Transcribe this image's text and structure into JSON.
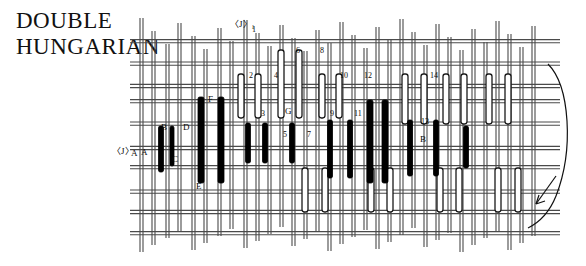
{
  "title": {
    "line1": "DOUBLE",
    "line2": "HUNGARIAN"
  },
  "markers": {
    "j_top": "〈J〉₁",
    "j_left": "〈J〉",
    "a_left_1": "A",
    "a_left_2": "A"
  },
  "letter_labels": [
    {
      "text": "B",
      "x": 161,
      "y": 123
    },
    {
      "text": "D",
      "x": 183,
      "y": 123
    },
    {
      "text": "C",
      "x": 172,
      "y": 155
    },
    {
      "text": "F",
      "x": 208,
      "y": 95
    },
    {
      "text": "E",
      "x": 196,
      "y": 182
    },
    {
      "text": "G",
      "x": 285,
      "y": 107
    },
    {
      "text": "B",
      "x": 420,
      "y": 135
    }
  ],
  "number_labels": [
    {
      "text": "1",
      "x": 252,
      "y": 26
    },
    {
      "text": "2",
      "x": 249,
      "y": 72
    },
    {
      "text": "4",
      "x": 274,
      "y": 72
    },
    {
      "text": "6",
      "x": 296,
      "y": 47
    },
    {
      "text": "8",
      "x": 320,
      "y": 47
    },
    {
      "text": "3",
      "x": 261,
      "y": 110
    },
    {
      "text": "5",
      "x": 283,
      "y": 131
    },
    {
      "text": "7",
      "x": 307,
      "y": 131
    },
    {
      "text": "10",
      "x": 340,
      "y": 72
    },
    {
      "text": "12",
      "x": 364,
      "y": 72
    },
    {
      "text": "9",
      "x": 330,
      "y": 110
    },
    {
      "text": "11",
      "x": 354,
      "y": 110
    },
    {
      "text": "14",
      "x": 430,
      "y": 72
    },
    {
      "text": "13",
      "x": 421,
      "y": 118
    }
  ],
  "colors": {
    "ink": "#111111",
    "grid_line": "#4a4a4a",
    "filled_bar": "#000000",
    "open_bar_fill": "#ffffff",
    "open_bar_stroke": "#1a1a1a",
    "background": "#ffffff"
  },
  "chart_data": {
    "type": "table",
    "title": "DOUBLE HUNGARIAN",
    "grid": {
      "horizontal_strands_y": [
        40,
        62,
        84,
        100,
        122,
        146,
        166,
        190,
        210,
        232
      ],
      "vertical_strands_x": [
        140,
        152,
        166,
        178,
        192,
        204,
        218,
        230,
        244,
        256,
        268,
        280,
        292,
        304,
        316,
        328,
        340,
        352,
        364,
        376,
        388,
        400,
        412,
        424,
        436,
        448,
        460,
        472,
        484,
        496,
        508,
        520,
        532
      ],
      "grid_on": true
    },
    "filled_bars": [
      {
        "x": 161,
        "y0": 126,
        "y1": 172,
        "w": 5
      },
      {
        "x": 172,
        "y0": 126,
        "y1": 166,
        "w": 4
      },
      {
        "x": 201,
        "y0": 97,
        "y1": 183,
        "w": 6
      },
      {
        "x": 221,
        "y0": 97,
        "y1": 183,
        "w": 6
      },
      {
        "x": 248,
        "y0": 123,
        "y1": 163,
        "w": 5
      },
      {
        "x": 265,
        "y0": 123,
        "y1": 163,
        "w": 5
      },
      {
        "x": 292,
        "y0": 123,
        "y1": 163,
        "w": 5
      },
      {
        "x": 330,
        "y0": 120,
        "y1": 178,
        "w": 5
      },
      {
        "x": 350,
        "y0": 120,
        "y1": 178,
        "w": 5
      },
      {
        "x": 370,
        "y0": 100,
        "y1": 183,
        "w": 6
      },
      {
        "x": 385,
        "y0": 100,
        "y1": 183,
        "w": 6
      },
      {
        "x": 410,
        "y0": 120,
        "y1": 176,
        "w": 5
      },
      {
        "x": 436,
        "y0": 120,
        "y1": 176,
        "w": 5
      },
      {
        "x": 466,
        "y0": 126,
        "y1": 168,
        "w": 5
      }
    ],
    "open_bars": [
      {
        "x": 241,
        "y0": 74,
        "y1": 118,
        "w": 6
      },
      {
        "x": 258,
        "y0": 74,
        "y1": 118,
        "w": 6
      },
      {
        "x": 281,
        "y0": 50,
        "y1": 118,
        "w": 6
      },
      {
        "x": 299,
        "y0": 50,
        "y1": 118,
        "w": 6
      },
      {
        "x": 322,
        "y0": 74,
        "y1": 118,
        "w": 6
      },
      {
        "x": 339,
        "y0": 74,
        "y1": 118,
        "w": 6
      },
      {
        "x": 405,
        "y0": 74,
        "y1": 124,
        "w": 6
      },
      {
        "x": 424,
        "y0": 74,
        "y1": 124,
        "w": 6
      },
      {
        "x": 446,
        "y0": 74,
        "y1": 124,
        "w": 6
      },
      {
        "x": 464,
        "y0": 74,
        "y1": 124,
        "w": 6
      },
      {
        "x": 489,
        "y0": 74,
        "y1": 124,
        "w": 6
      },
      {
        "x": 508,
        "y0": 74,
        "y1": 124,
        "w": 6
      },
      {
        "x": 305,
        "y0": 168,
        "y1": 212,
        "w": 6
      },
      {
        "x": 325,
        "y0": 168,
        "y1": 212,
        "w": 6
      },
      {
        "x": 371,
        "y0": 168,
        "y1": 212,
        "w": 6
      },
      {
        "x": 390,
        "y0": 168,
        "y1": 212,
        "w": 6
      },
      {
        "x": 440,
        "y0": 168,
        "y1": 212,
        "w": 6
      },
      {
        "x": 459,
        "y0": 168,
        "y1": 212,
        "w": 6
      },
      {
        "x": 498,
        "y0": 168,
        "y1": 212,
        "w": 6
      },
      {
        "x": 518,
        "y0": 168,
        "y1": 212,
        "w": 6
      }
    ],
    "bracket": {
      "shape": "right-side curved brace",
      "arrow": "down-left pointer at lower right"
    }
  }
}
